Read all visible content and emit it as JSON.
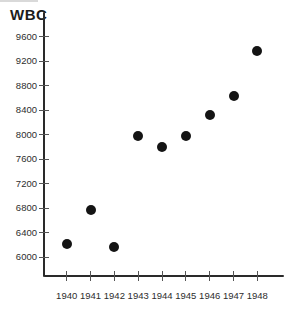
{
  "page": {
    "background": "#ffffff"
  },
  "chart_data": {
    "type": "scatter",
    "title": "WBC",
    "ylabel": "WBC",
    "xlabel": "",
    "x": [
      1940,
      1941,
      1942,
      1943,
      1944,
      1945,
      1946,
      1947,
      1948
    ],
    "y": [
      6210,
      6780,
      6170,
      7985,
      7805,
      7975,
      8320,
      8640,
      9370
    ],
    "xtick_labels": [
      "1940",
      "1941",
      "1942",
      "1943",
      "1944",
      "1945",
      "1946",
      "1947",
      "1948"
    ],
    "yticks": [
      6000,
      6400,
      6800,
      7200,
      7600,
      8000,
      8400,
      8800,
      9200,
      9600
    ],
    "xlim": [
      1939.1,
      1949.1
    ],
    "ylim": [
      5690,
      9930
    ],
    "grid": false,
    "legend": null,
    "marker": {
      "shape": "circle",
      "color": "#141414",
      "diameter_px": 10
    },
    "axis_color": "#2a2a2a",
    "tick_color": "#555555",
    "label_color": "#2d2d2d"
  }
}
